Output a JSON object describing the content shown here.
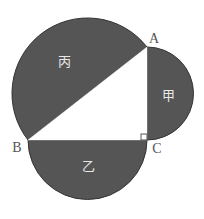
{
  "diagram": {
    "colors": {
      "fill": "#555555",
      "triangle": "#ffffff",
      "stroke": "#333333",
      "region_label": "#e8e8e8",
      "vertex_label": "#555555"
    },
    "vertices": {
      "A": {
        "label": "A",
        "x": 147,
        "y": 47
      },
      "B": {
        "label": "B",
        "x": 28,
        "y": 140
      },
      "C": {
        "label": "C",
        "x": 147,
        "y": 140
      }
    },
    "regions": {
      "jia": {
        "label": "甲",
        "side": "AC"
      },
      "yi": {
        "label": "乙",
        "side": "BC"
      },
      "bing": {
        "label": "丙",
        "side": "AB"
      }
    },
    "right_angle_at": "C"
  }
}
